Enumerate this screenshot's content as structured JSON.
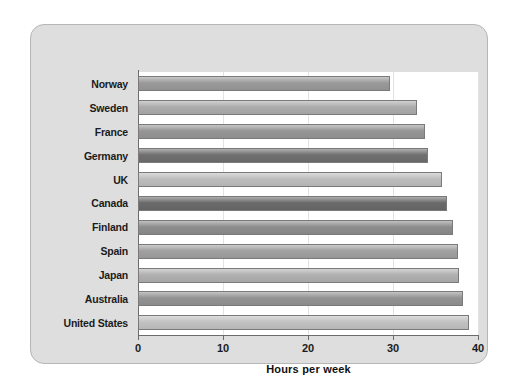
{
  "chart_data": {
    "type": "bar",
    "orientation": "horizontal",
    "title": "",
    "xlabel": "Hours per week",
    "ylabel": "",
    "xlim": [
      0,
      40
    ],
    "ylim": null,
    "grid": true,
    "legend": null,
    "xticks": [
      0,
      10,
      20,
      30,
      40
    ],
    "xtick_labels": [
      "0",
      "10",
      "20",
      "30",
      "40"
    ],
    "categories": [
      "Norway",
      "Sweden",
      "France",
      "Germany",
      "UK",
      "Canada",
      "Finland",
      "Spain",
      "Japan",
      "Australia",
      "United States"
    ],
    "values": [
      29.6,
      32.8,
      33.8,
      34.1,
      35.8,
      36.4,
      37.0,
      37.6,
      37.8,
      38.2,
      38.9
    ],
    "bar_colors": [
      "#9a9a9a",
      "#acacac",
      "#969696",
      "#6f6f6f",
      "#bdbdbd",
      "#6a6a6a",
      "#8d8d8d",
      "#a0a0a0",
      "#b0b0b0",
      "#939393",
      "#c2c2c2"
    ]
  },
  "figure": {
    "panel_background": "#dedede",
    "plot_background": "#ffffff",
    "axis_color": "#6b6b6b",
    "gridline_color": "#e2e2e2",
    "text_color": "#1b1b1b"
  }
}
